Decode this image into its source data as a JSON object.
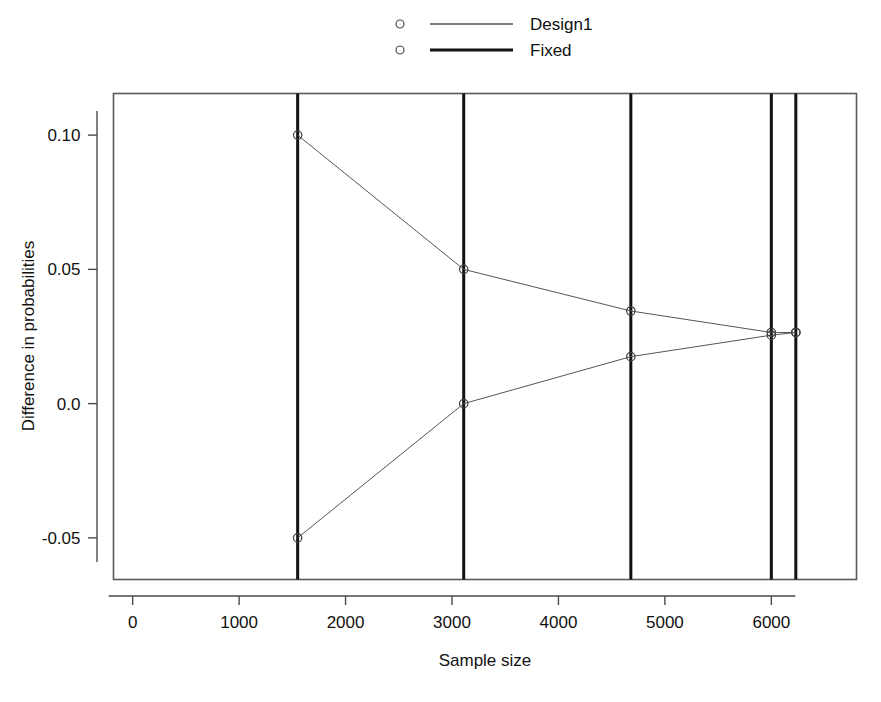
{
  "chart_data": {
    "type": "line",
    "title": "",
    "xlabel": "Sample size",
    "ylabel": "Difference in probabilities",
    "xlim": [
      -180,
      6800
    ],
    "ylim": [
      -0.0655,
      0.1155
    ],
    "xticks": [
      0,
      1000,
      2000,
      3000,
      4000,
      5000,
      6000
    ],
    "xtick_labels": [
      "0",
      "1000",
      "2000",
      "3000",
      "4000",
      "5000",
      "6000"
    ],
    "yticks": [
      -0.05,
      0.0,
      0.05,
      0.1
    ],
    "ytick_labels": [
      "-0.05",
      "0.0",
      "0.05",
      "0.10"
    ],
    "grid": false,
    "legend_position": "top-center",
    "series": [
      {
        "name": "Design1",
        "marker": "circle",
        "color": "#555555",
        "linewidth": 1,
        "upper_bound": {
          "x": [
            1550,
            3110,
            4680,
            6000,
            6230
          ],
          "y": [
            0.1,
            0.05,
            0.0345,
            0.0265,
            0.0265
          ]
        },
        "lower_bound": {
          "x": [
            1550,
            3110,
            4680,
            6000,
            6230
          ],
          "y": [
            -0.05,
            0.0,
            0.0175,
            0.0255,
            0.0265
          ]
        }
      },
      {
        "name": "Fixed",
        "marker": "circle",
        "color": "#111111",
        "linewidth": 3,
        "vertical_lines": [
          1550,
          3110,
          4680,
          6000,
          6230
        ]
      }
    ]
  },
  "legend": {
    "entries": [
      {
        "label": "Design1",
        "marker": "circle",
        "line_color": "#555555",
        "line_width": 1.6
      },
      {
        "label": "Fixed",
        "marker": "circle",
        "line_color": "#111111",
        "line_width": 3.2
      }
    ]
  },
  "axes": {
    "x_label": "Sample size",
    "y_label": "Difference in probabilities"
  }
}
